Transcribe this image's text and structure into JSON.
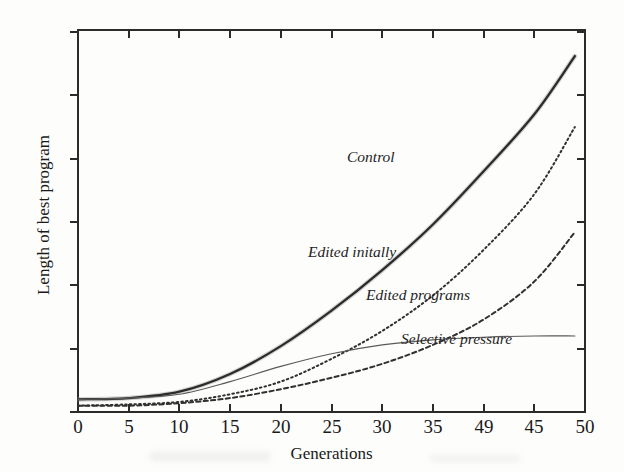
{
  "chart_data": {
    "type": "line",
    "title": "",
    "xlabel": "Generations",
    "ylabel": "Length of best program",
    "xlim": [
      0,
      50
    ],
    "ylim": [
      0,
      300
    ],
    "grid": false,
    "legend_position": "inline-annotations",
    "xticks": [
      "0",
      "5",
      "10",
      "15",
      "20",
      "25",
      "30",
      "35",
      "49",
      "45",
      "50"
    ],
    "xtick_values": [
      0,
      5,
      10,
      15,
      20,
      25,
      30,
      35,
      40,
      45,
      50
    ],
    "yticks": [
      "0",
      "50",
      "100",
      "150",
      "200",
      "250",
      "300"
    ],
    "ytick_values": [
      0,
      50,
      100,
      150,
      200,
      250,
      300
    ],
    "x": [
      0,
      5,
      10,
      15,
      20,
      25,
      30,
      35,
      40,
      45,
      49
    ],
    "series": [
      {
        "name": "Control",
        "label": "Control",
        "style": "solid-thick",
        "color": "#2b2b2b",
        "values": [
          10,
          11,
          16,
          30,
          52,
          80,
          112,
          148,
          190,
          235,
          281
        ]
      },
      {
        "name": "Edited initally",
        "label": "Edited initally",
        "style": "dotted",
        "color": "#303030",
        "values": [
          5,
          6,
          8,
          14,
          24,
          42,
          64,
          92,
          128,
          172,
          225
        ]
      },
      {
        "name": "Edited programs",
        "label": "Edited programs",
        "style": "dashed",
        "color": "#303030",
        "values": [
          5,
          5,
          7,
          11,
          18,
          27,
          38,
          53,
          73,
          103,
          142
        ]
      },
      {
        "name": "Selective pressure",
        "label": "Selective pressure",
        "style": "solid-thin",
        "color": "#5a5a5a",
        "values": [
          10,
          11,
          14,
          24,
          36,
          46,
          53,
          57,
          59,
          60,
          60
        ]
      }
    ]
  },
  "annotations": {
    "control": "Control",
    "edited_initally": "Edited initally",
    "edited_programs": "Edited programs",
    "selective_pressure": "Selective pressure"
  }
}
